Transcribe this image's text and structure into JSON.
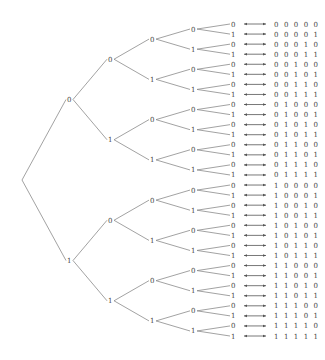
{
  "diagram": {
    "title": "",
    "type": "binary-tree",
    "depth": 5,
    "root": {
      "x": 22,
      "label": ""
    },
    "level_x": [
      22,
      69,
      110,
      152,
      193,
      233
    ],
    "leaf_y_start": 24,
    "leaf_y_step": 10.065,
    "arrow": {
      "x1": 244,
      "x2": 266,
      "icon": "double-headed-arrow-icon"
    },
    "code_x": 274,
    "colors": {
      "edge": "#8a8a8a",
      "text": "#444444",
      "arrow": "#555555"
    },
    "codes": [
      "0 0 0 0 0",
      "0 0 0 0 1",
      "0 0 0 1 0",
      "0 0 0 1 1",
      "0 0 1 0 0",
      "0 0 1 0 1",
      "0 0 1 1 0",
      "0 0 1 1 1",
      "0 1 0 0 0",
      "0 1 0 0 1",
      "0 1 0 1 0",
      "0 1 0 1 1",
      "0 1 1 0 0",
      "0 1 1 0 1",
      "0 1 1 1 0",
      "0 1 1 1 1",
      "1 0 0 0 0",
      "1 0 0 0 1",
      "1 0 0 1 0",
      "1 0 0 1 1",
      "1 0 1 0 0",
      "1 0 1 0 1",
      "1 0 1 1 0",
      "1 0 1 1 1",
      "1 1 0 0 0",
      "1 1 0 0 1",
      "1 1 0 1 0",
      "1 1 0 1 1",
      "1 1 1 0 0",
      "1 1 1 0 1",
      "1 1 1 1 0",
      "1 1 1 1 1"
    ],
    "branch_labels": [
      "0",
      "1"
    ]
  }
}
